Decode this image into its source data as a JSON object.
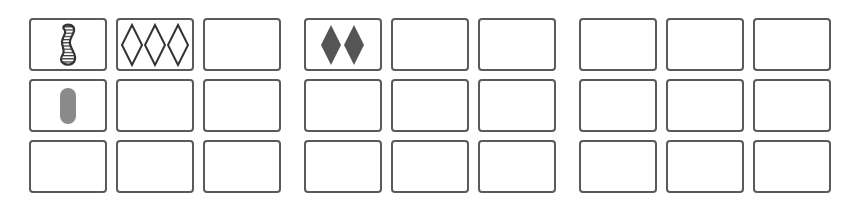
{
  "game": {
    "title": "Set card board",
    "layout": {
      "groups": 3,
      "rows_per_group": 3,
      "cols_per_group": 3
    },
    "colors": {
      "border": "#5a5a5a",
      "outline": "#333333",
      "solid_dark": "#555555",
      "solid_gray": "#8a8a8a",
      "background": "#ffffff"
    },
    "groups": [
      {
        "name": "group-1",
        "cards": [
          {
            "row": 0,
            "col": 0,
            "count": 1,
            "shape": "squiggle",
            "shading": "striped",
            "color": "#333333"
          },
          {
            "row": 0,
            "col": 1,
            "count": 3,
            "shape": "diamond",
            "shading": "open",
            "color": "#333333"
          },
          {
            "row": 0,
            "col": 2,
            "count": 0
          },
          {
            "row": 1,
            "col": 0,
            "count": 1,
            "shape": "oval",
            "shading": "solid",
            "color": "#8a8a8a"
          },
          {
            "row": 1,
            "col": 1,
            "count": 0
          },
          {
            "row": 1,
            "col": 2,
            "count": 0
          },
          {
            "row": 2,
            "col": 0,
            "count": 0
          },
          {
            "row": 2,
            "col": 1,
            "count": 0
          },
          {
            "row": 2,
            "col": 2,
            "count": 0
          }
        ]
      },
      {
        "name": "group-2",
        "cards": [
          {
            "row": 0,
            "col": 0,
            "count": 2,
            "shape": "diamond",
            "shading": "solid",
            "color": "#555555"
          },
          {
            "row": 0,
            "col": 1,
            "count": 0
          },
          {
            "row": 0,
            "col": 2,
            "count": 0
          },
          {
            "row": 1,
            "col": 0,
            "count": 0
          },
          {
            "row": 1,
            "col": 1,
            "count": 0
          },
          {
            "row": 1,
            "col": 2,
            "count": 0
          },
          {
            "row": 2,
            "col": 0,
            "count": 0
          },
          {
            "row": 2,
            "col": 1,
            "count": 0
          },
          {
            "row": 2,
            "col": 2,
            "count": 0
          }
        ]
      },
      {
        "name": "group-3",
        "cards": [
          {
            "row": 0,
            "col": 0,
            "count": 0
          },
          {
            "row": 0,
            "col": 1,
            "count": 0
          },
          {
            "row": 0,
            "col": 2,
            "count": 0
          },
          {
            "row": 1,
            "col": 0,
            "count": 0
          },
          {
            "row": 1,
            "col": 1,
            "count": 0
          },
          {
            "row": 1,
            "col": 2,
            "count": 0
          },
          {
            "row": 2,
            "col": 0,
            "count": 0
          },
          {
            "row": 2,
            "col": 1,
            "count": 0
          },
          {
            "row": 2,
            "col": 2,
            "count": 0
          }
        ]
      }
    ]
  }
}
